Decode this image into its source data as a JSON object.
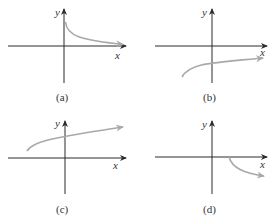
{
  "figure": {
    "axis_color": "#2b2b2b",
    "curve_color": "#a9a9a9",
    "panels": [
      {
        "id": "a",
        "label": "(a)",
        "x_axis_label": "x",
        "y_axis_label": "y",
        "description": "decreasing curve starting on positive y-axis, approaching x-axis from above"
      },
      {
        "id": "b",
        "label": "(b)",
        "x_axis_label": "x",
        "y_axis_label": "y",
        "description": "increasing square-root-like curve starting in third quadrant, staying below x-axis"
      },
      {
        "id": "c",
        "label": "(c)",
        "x_axis_label": "x",
        "y_axis_label": "y",
        "description": "increasing square-root-like curve starting in second quadrant, above x-axis"
      },
      {
        "id": "d",
        "label": "(d)",
        "x_axis_label": "x",
        "y_axis_label": "y",
        "description": "decreasing curve starting on positive x-axis, going down into fourth quadrant"
      }
    ]
  }
}
